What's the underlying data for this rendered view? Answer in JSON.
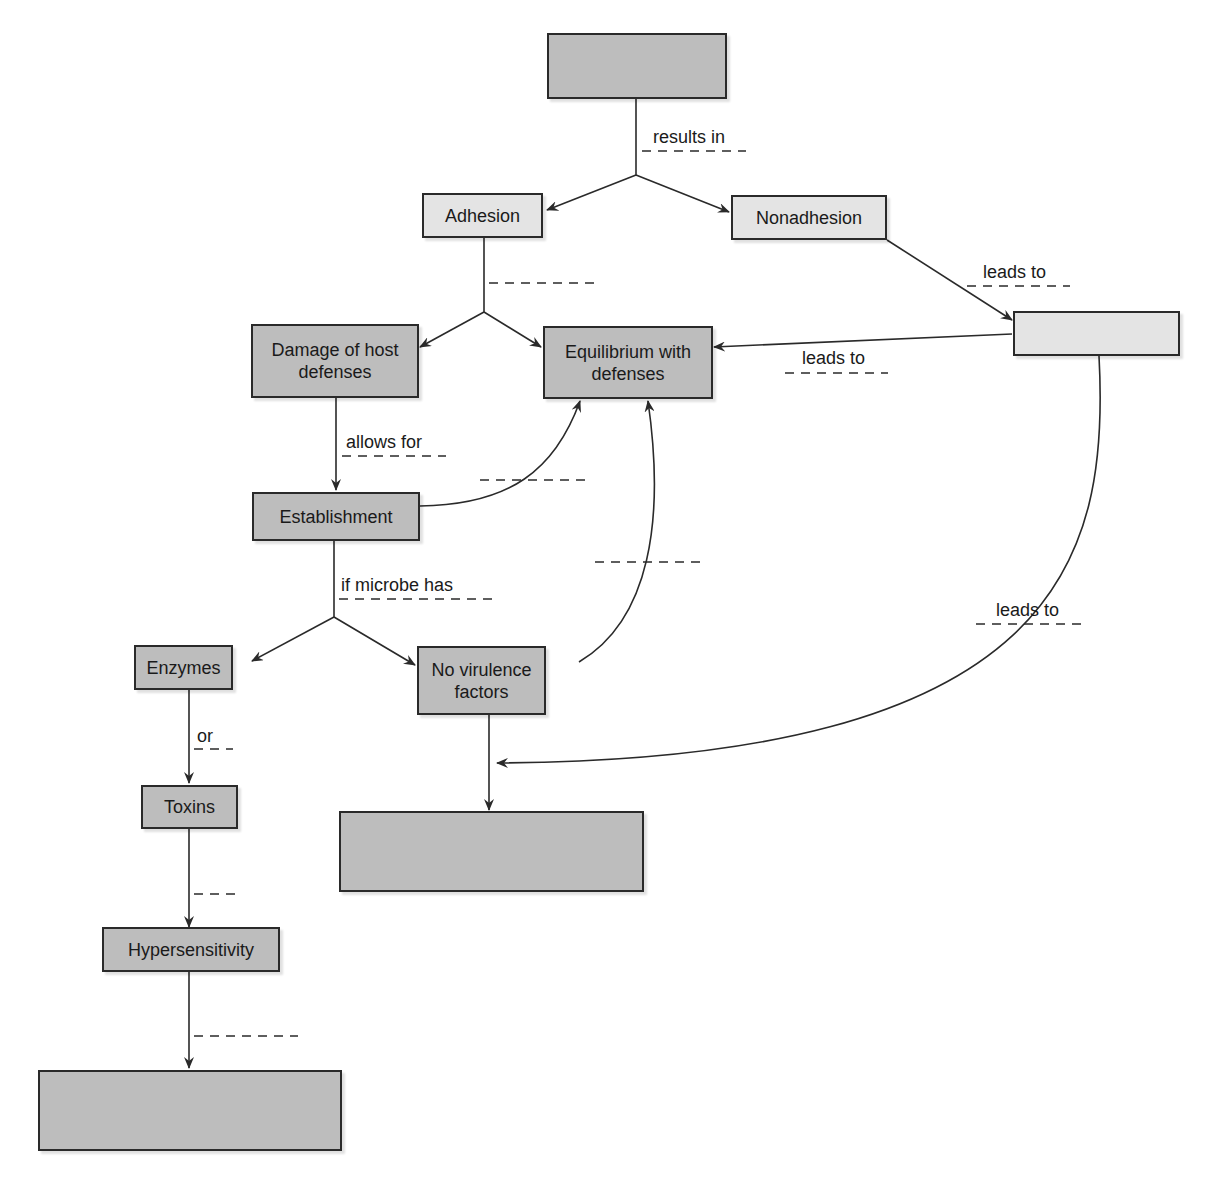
{
  "diagram": {
    "type": "concept-map",
    "nodes": {
      "top_blank": {
        "label": "",
        "shade": "dark"
      },
      "adhesion": {
        "label": "Adhesion",
        "shade": "light"
      },
      "nonadhesion": {
        "label": "Nonadhesion",
        "shade": "light"
      },
      "right_blank": {
        "label": "",
        "shade": "light"
      },
      "damage": {
        "label": "Damage of host defenses",
        "shade": "dark"
      },
      "equilibrium": {
        "label": "Equilibrium with defenses",
        "shade": "dark"
      },
      "establishment": {
        "label": "Establishment",
        "shade": "dark"
      },
      "enzymes": {
        "label": "Enzymes",
        "shade": "dark"
      },
      "no_virulence": {
        "label": "No virulence factors",
        "shade": "dark"
      },
      "toxins": {
        "label": "Toxins",
        "shade": "dark"
      },
      "hypersensitivity": {
        "label": "Hypersensitivity",
        "shade": "dark"
      },
      "middle_blank": {
        "label": "",
        "shade": "dark"
      },
      "bottom_blank": {
        "label": "",
        "shade": "dark"
      }
    },
    "edge_labels": {
      "results_in": "results in",
      "leads_to_1": "leads to",
      "leads_to_2": "leads to",
      "leads_to_3": "leads to",
      "allows_for": "allows for",
      "if_microbe_has": "if microbe has",
      "or": "or"
    },
    "blank_edge_labels": [
      "adhesion-branch",
      "establishment-to-equilibrium",
      "no-virulence-to-equilibrium",
      "toxins-to-hypersensitivity",
      "hypersensitivity-to-bottom"
    ],
    "colors": {
      "dark_box": "#bdbdbd",
      "light_box": "#e4e4e4",
      "line": "#2a2a2a"
    }
  }
}
